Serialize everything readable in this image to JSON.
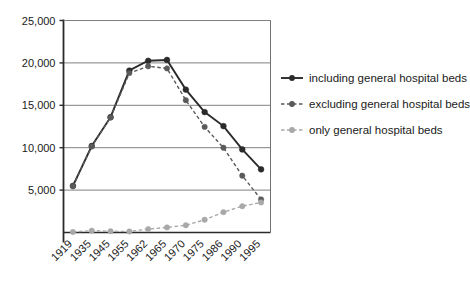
{
  "chart_data": {
    "type": "line",
    "title": "",
    "xlabel": "",
    "ylabel": "",
    "grid": true,
    "legend_position": "right",
    "ylim": [
      0,
      25000
    ],
    "yticks": [
      5000,
      10000,
      15000,
      20000,
      25000
    ],
    "ytick_labels": [
      "5,000",
      "10,000",
      "15,000",
      "20,000",
      "25,000"
    ],
    "categories": [
      "1919",
      "1935",
      "1945",
      "1955",
      "1962",
      "1965",
      "1970",
      "1975",
      "1986",
      "1990",
      "1995"
    ],
    "series": [
      {
        "name": "including general hospital beds",
        "color": "#2b2b2b",
        "style": "solid",
        "values": [
          5500,
          10200,
          13600,
          19100,
          20250,
          20350,
          16850,
          14200,
          12550,
          9800,
          7450
        ]
      },
      {
        "name": "excluding general hospital beds",
        "color": "#5a5a5a",
        "style": "dashed",
        "values": [
          5450,
          10150,
          13550,
          18800,
          19600,
          19350,
          15600,
          12450,
          10000,
          6700,
          3900
        ]
      },
      {
        "name": "only general hospital beds",
        "color": "#a8a8a8",
        "style": "dashed",
        "values": [
          60,
          220,
          150,
          120,
          400,
          600,
          850,
          1500,
          2400,
          3100,
          3550
        ]
      }
    ]
  },
  "legend": {
    "items": [
      {
        "label": "including general hospital beds"
      },
      {
        "label": "excluding general hospital beds"
      },
      {
        "label": "only general hospital beds"
      }
    ]
  },
  "axis": {
    "y_tick_labels": [
      "25,000",
      "20,000",
      "15,000",
      "10,000",
      "5,000"
    ],
    "x_tick_labels": [
      "1919",
      "1935",
      "1945",
      "1955",
      "1962",
      "1965",
      "1970",
      "1975",
      "1986",
      "1990",
      "1995"
    ]
  }
}
